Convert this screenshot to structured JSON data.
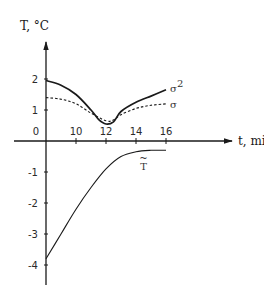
{
  "chart_data": {
    "type": "line",
    "title": "",
    "xlabel": "t, min",
    "ylabel": "T, °C",
    "x_origin_label": "0",
    "x_origin_value": 8,
    "xlim": [
      8,
      17
    ],
    "ylim": [
      -4.7,
      2.3
    ],
    "x_ticks": [
      10,
      12,
      14,
      16
    ],
    "x_tick_labels": [
      "10",
      "12",
      "14",
      "16"
    ],
    "y_ticks": [
      2,
      1,
      -1,
      -2,
      -3,
      -4
    ],
    "y_tick_labels": [
      "2",
      "1",
      "-1",
      "-2",
      "-3",
      "-4"
    ],
    "y_zero_label": "0",
    "grid": false,
    "legend": "inline labels at line ends",
    "series": [
      {
        "name": "σ²",
        "label": "σ",
        "label_sup": "2",
        "style": "solid",
        "x": [
          8,
          9,
          10,
          11,
          11.5,
          12,
          12.5,
          13,
          14,
          15,
          16
        ],
        "y": [
          1.95,
          1.8,
          1.5,
          1.0,
          0.7,
          0.55,
          0.62,
          0.95,
          1.25,
          1.45,
          1.65
        ]
      },
      {
        "name": "σ",
        "label": "σ",
        "style": "dashed",
        "x": [
          8,
          9,
          10,
          11,
          12,
          12.5,
          13,
          14,
          15,
          16
        ],
        "y": [
          1.4,
          1.35,
          1.2,
          0.9,
          0.65,
          0.68,
          0.85,
          1.05,
          1.15,
          1.2
        ]
      },
      {
        "name": "T̃",
        "label": "T",
        "style": "solid",
        "x": [
          8,
          9,
          10,
          11,
          12,
          13,
          14,
          15,
          16
        ],
        "y": [
          -3.8,
          -3.0,
          -2.2,
          -1.5,
          -0.9,
          -0.5,
          -0.35,
          -0.3,
          -0.3
        ]
      }
    ],
    "colors": {
      "line": "#1a1a1a",
      "axis": "#1a1a1a"
    }
  }
}
